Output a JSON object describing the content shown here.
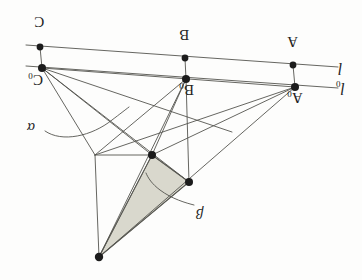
{
  "figure": {
    "kind": "geometry-diagram",
    "orientation_note": "180-rotated",
    "background_color": "#fdfdfc",
    "ink_color": "#4a4a46",
    "node_color": "#1c1c1c",
    "shaded_fill": "#d9d8cd",
    "shaded_stroke": "#6f6f68"
  },
  "labels": {
    "point_c": "C",
    "point_c0_base": "C",
    "point_c0_sub": "0",
    "point_b": "B",
    "point_b0_base": "B",
    "point_b0_sub": "0",
    "point_a": "A",
    "point_a0_base": "A",
    "point_a0_sub": "0",
    "line_l": "l",
    "line_l0_base": "l",
    "line_l0_sub": "0",
    "region_alpha": "α",
    "region_beta": "β"
  },
  "nodes": [
    {
      "name": "C",
      "x": 40,
      "y": 47
    },
    {
      "name": "B",
      "x": 185,
      "y": 58
    },
    {
      "name": "A",
      "x": 293,
      "y": 65
    },
    {
      "name": "C0",
      "x": 42,
      "y": 68
    },
    {
      "name": "B0",
      "x": 186,
      "y": 79
    },
    {
      "name": "A0",
      "x": 295,
      "y": 87
    },
    {
      "name": "P1",
      "x": 152,
      "y": 155
    },
    {
      "name": "P2",
      "x": 189,
      "y": 182
    },
    {
      "name": "P3",
      "x": 99,
      "y": 257
    },
    {
      "name": "P4",
      "x": 95,
      "y": 155
    }
  ],
  "lines": {
    "l": {
      "x1": 26,
      "y1": 45,
      "x2": 338,
      "y2": 67
    },
    "l0": {
      "x1": 26,
      "y1": 66,
      "x2": 338,
      "y2": 88
    }
  },
  "shaded_triangle": [
    {
      "x": 152,
      "y": 155
    },
    {
      "x": 189,
      "y": 182
    },
    {
      "x": 99,
      "y": 257
    }
  ],
  "label_positions": {
    "point_c": {
      "x": 34,
      "y": 14
    },
    "point_c0": {
      "x": 28,
      "y": 72
    },
    "point_b": {
      "x": 179,
      "y": 27
    },
    "point_b0": {
      "x": 179,
      "y": 82
    },
    "point_a": {
      "x": 287,
      "y": 34
    },
    "point_a0": {
      "x": 287,
      "y": 90
    },
    "line_l": {
      "x": 338,
      "y": 60
    },
    "line_l0": {
      "x": 338,
      "y": 80
    },
    "alpha": {
      "x": 27,
      "y": 120
    },
    "beta": {
      "x": 196,
      "y": 206
    }
  }
}
